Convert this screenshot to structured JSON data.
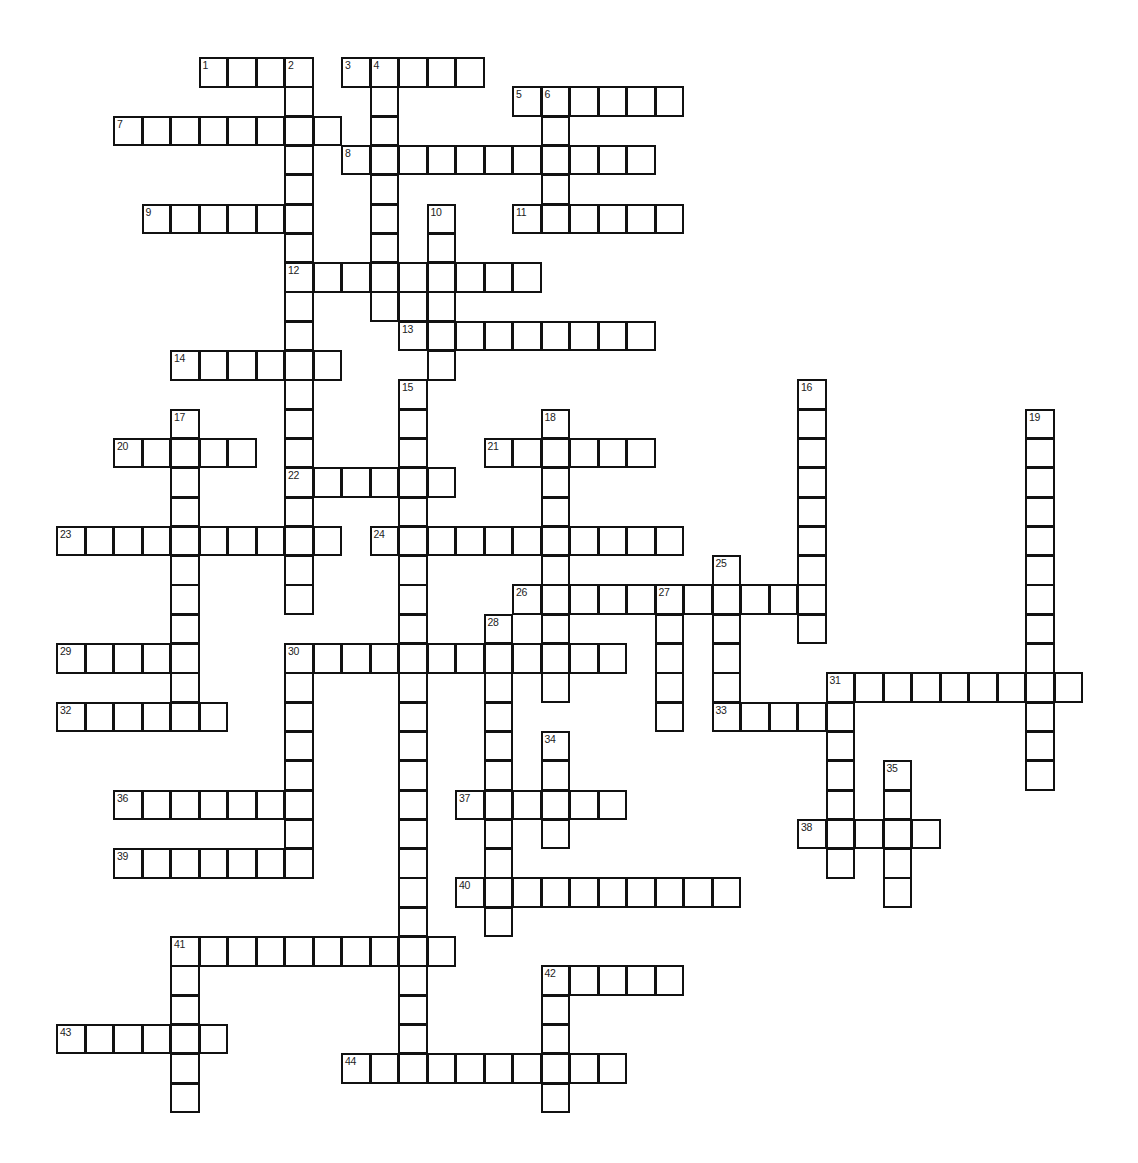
{
  "puzzle": {
    "type": "crossword",
    "grid": {
      "origin_x": 56,
      "origin_y": 57,
      "cell_w": 28.5,
      "cell_h": 29.3
    },
    "colors": {
      "line": "#111111",
      "background": "#ffffff",
      "number": "#222222"
    },
    "words": [
      {
        "num": 1,
        "dir": "across",
        "row": 0,
        "col": 5,
        "len": 4
      },
      {
        "num": 2,
        "dir": "down",
        "row": 0,
        "col": 8,
        "len": 19
      },
      {
        "num": 3,
        "dir": "across",
        "row": 0,
        "col": 10,
        "len": 5
      },
      {
        "num": 4,
        "dir": "down",
        "row": 0,
        "col": 11,
        "len": 9
      },
      {
        "num": 5,
        "dir": "across",
        "row": 1,
        "col": 16,
        "len": 6
      },
      {
        "num": 6,
        "dir": "down",
        "row": 1,
        "col": 17,
        "len": 5
      },
      {
        "num": 7,
        "dir": "across",
        "row": 2,
        "col": 2,
        "len": 8
      },
      {
        "num": 8,
        "dir": "across",
        "row": 3,
        "col": 10,
        "len": 11
      },
      {
        "num": 9,
        "dir": "across",
        "row": 5,
        "col": 3,
        "len": 6
      },
      {
        "num": 10,
        "dir": "down",
        "row": 5,
        "col": 13,
        "len": 6
      },
      {
        "num": 11,
        "dir": "across",
        "row": 5,
        "col": 16,
        "len": 6
      },
      {
        "num": 12,
        "dir": "across",
        "row": 7,
        "col": 8,
        "len": 9
      },
      {
        "num": 13,
        "dir": "across",
        "row": 9,
        "col": 12,
        "len": 9
      },
      {
        "num": 14,
        "dir": "across",
        "row": 10,
        "col": 4,
        "len": 6
      },
      {
        "num": 15,
        "dir": "down",
        "row": 11,
        "col": 12,
        "len": 24
      },
      {
        "num": 16,
        "dir": "down",
        "row": 11,
        "col": 26,
        "len": 9
      },
      {
        "num": 17,
        "dir": "down",
        "row": 12,
        "col": 4,
        "len": 10
      },
      {
        "num": 18,
        "dir": "down",
        "row": 12,
        "col": 17,
        "len": 10
      },
      {
        "num": 19,
        "dir": "down",
        "row": 12,
        "col": 34,
        "len": 13
      },
      {
        "num": 20,
        "dir": "across",
        "row": 13,
        "col": 2,
        "len": 5
      },
      {
        "num": 21,
        "dir": "across",
        "row": 13,
        "col": 15,
        "len": 6
      },
      {
        "num": 22,
        "dir": "across",
        "row": 14,
        "col": 8,
        "len": 6
      },
      {
        "num": 23,
        "dir": "across",
        "row": 16,
        "col": 0,
        "len": 10
      },
      {
        "num": 24,
        "dir": "across",
        "row": 16,
        "col": 11,
        "len": 11
      },
      {
        "num": 25,
        "dir": "down",
        "row": 17,
        "col": 23,
        "len": 6
      },
      {
        "num": 26,
        "dir": "across",
        "row": 18,
        "col": 16,
        "len": 11
      },
      {
        "num": 27,
        "dir": "down",
        "row": 18,
        "col": 21,
        "len": 5
      },
      {
        "num": 28,
        "dir": "down",
        "row": 19,
        "col": 15,
        "len": 11
      },
      {
        "num": 29,
        "dir": "across",
        "row": 20,
        "col": 0,
        "len": 5
      },
      {
        "num": 30,
        "dir": "across",
        "row": 20,
        "col": 8,
        "len": 12
      },
      {
        "num": 30,
        "dir": "down",
        "row": 20,
        "col": 8,
        "len": 8
      },
      {
        "num": 31,
        "dir": "across",
        "row": 21,
        "col": 27,
        "len": 9
      },
      {
        "num": 31,
        "dir": "down",
        "row": 21,
        "col": 27,
        "len": 7
      },
      {
        "num": 32,
        "dir": "across",
        "row": 22,
        "col": 0,
        "len": 6
      },
      {
        "num": 33,
        "dir": "across",
        "row": 22,
        "col": 23,
        "len": 5
      },
      {
        "num": 34,
        "dir": "down",
        "row": 23,
        "col": 17,
        "len": 4
      },
      {
        "num": 35,
        "dir": "down",
        "row": 24,
        "col": 29,
        "len": 5
      },
      {
        "num": 36,
        "dir": "across",
        "row": 25,
        "col": 2,
        "len": 7
      },
      {
        "num": 37,
        "dir": "across",
        "row": 25,
        "col": 14,
        "len": 6
      },
      {
        "num": 38,
        "dir": "across",
        "row": 26,
        "col": 26,
        "len": 5
      },
      {
        "num": 39,
        "dir": "across",
        "row": 27,
        "col": 2,
        "len": 7
      },
      {
        "num": 40,
        "dir": "across",
        "row": 28,
        "col": 14,
        "len": 10
      },
      {
        "num": 41,
        "dir": "across",
        "row": 30,
        "col": 4,
        "len": 10
      },
      {
        "num": 41,
        "dir": "down",
        "row": 30,
        "col": 4,
        "len": 6
      },
      {
        "num": 42,
        "dir": "across",
        "row": 31,
        "col": 17,
        "len": 5
      },
      {
        "num": 42,
        "dir": "down",
        "row": 31,
        "col": 17,
        "len": 5
      },
      {
        "num": 43,
        "dir": "across",
        "row": 33,
        "col": 0,
        "len": 6
      },
      {
        "num": 44,
        "dir": "across",
        "row": 34,
        "col": 10,
        "len": 10
      }
    ],
    "extra_cells": [
      {
        "row": 8,
        "col": 12
      }
    ]
  }
}
